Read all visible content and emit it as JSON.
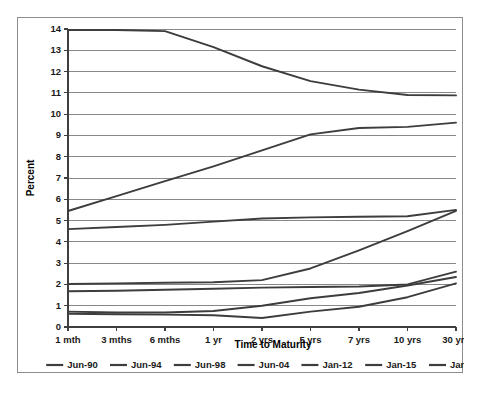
{
  "chart_data": {
    "type": "line",
    "title": "",
    "subtitle": "",
    "xlabel": "Time to Maturity",
    "ylabel": "Percent",
    "categories": [
      "1 mth",
      "3 mths",
      "6 mths",
      "1 yr",
      "2 yrs",
      "5 yrs",
      "7 yrs",
      "10 yrs",
      "30 yrs"
    ],
    "ylim": [
      0,
      14
    ],
    "ytick_labels": [
      "0",
      "1",
      "2",
      "3",
      "4",
      "5",
      "6",
      "7",
      "8",
      "9",
      "10",
      "11",
      "12",
      "13",
      "14"
    ],
    "ytick_values": [
      0,
      1,
      2,
      3,
      4,
      5,
      6,
      7,
      8,
      9,
      10,
      11,
      12,
      13,
      14
    ],
    "grid": true,
    "grid_axis": "y",
    "legend_position": "bottom",
    "series": [
      {
        "name": "Jun-90",
        "color": "#3d3d3d",
        "values": [
          13.95,
          13.95,
          13.9,
          13.15,
          12.25,
          11.55,
          11.15,
          10.9,
          10.88
        ]
      },
      {
        "name": "Jun-94",
        "color": "#3d3d3d",
        "values": [
          5.45,
          6.15,
          6.85,
          7.55,
          8.3,
          9.05,
          9.35,
          9.4,
          9.6
        ]
      },
      {
        "name": "Jun-98",
        "color": "#3d3d3d",
        "values": [
          4.6,
          4.7,
          4.8,
          4.95,
          5.1,
          5.15,
          5.18,
          5.2,
          5.5
        ]
      },
      {
        "name": "Jun-04",
        "color": "#3d3d3d",
        "values": [
          2.02,
          2.05,
          2.08,
          2.1,
          2.2,
          2.75,
          3.6,
          4.5,
          5.45
        ]
      },
      {
        "name": "Jan-12",
        "color": "#3d3d3d",
        "values": [
          1.68,
          1.7,
          1.75,
          1.8,
          1.85,
          1.88,
          1.9,
          2.0,
          2.6
        ]
      },
      {
        "name": "Jan-15",
        "color": "#3d3d3d",
        "values": [
          0.72,
          0.68,
          0.68,
          0.75,
          1.0,
          1.35,
          1.6,
          1.95,
          2.35
        ]
      },
      {
        "name": "Jan-19",
        "color": "#3d3d3d",
        "values": [
          0.62,
          0.6,
          0.58,
          0.55,
          0.42,
          0.72,
          0.95,
          1.4,
          2.05
        ]
      }
    ]
  },
  "legend": {
    "entries": [
      "Jun-90",
      "Jun-94",
      "Jun-98",
      "Jun-04",
      "Jan-12",
      "Jan-15",
      "Jan-19"
    ]
  },
  "colors": {
    "background": "#ffffff",
    "frame": "#8d8d8d",
    "gridline": "#878787",
    "axis": "#3f3f3f",
    "series_line": "#3d3d3d",
    "text": "#1a1a1a"
  }
}
